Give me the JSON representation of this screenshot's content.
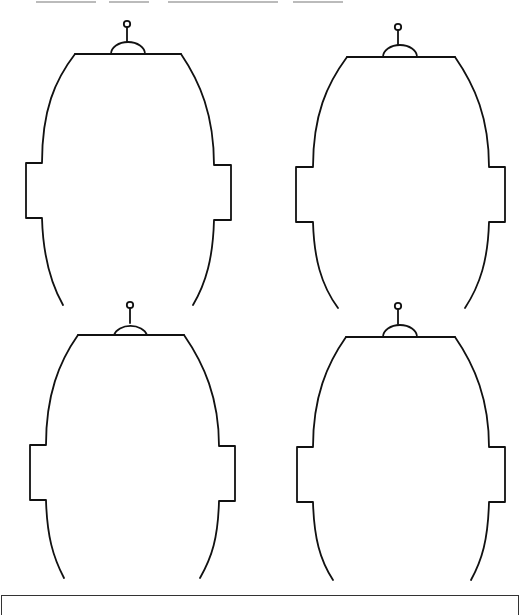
{
  "page": {
    "heading_visible": false,
    "heading_note": "clipped-at-top-edge"
  },
  "worksheet": {
    "figure_count": 4,
    "figure_type": "robot-head-outline",
    "stroke_color": "#111111",
    "background": "#ffffff",
    "figures": [
      {
        "id": "robot-head-top-left",
        "position": "top-left"
      },
      {
        "id": "robot-head-top-right",
        "position": "top-right"
      },
      {
        "id": "robot-head-bottom-left",
        "position": "bottom-left"
      },
      {
        "id": "robot-head-bottom-right",
        "position": "bottom-right"
      }
    ]
  },
  "answer_box": {
    "border_color": "#333333"
  }
}
